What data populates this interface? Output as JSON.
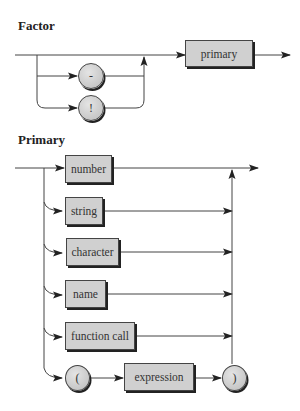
{
  "factor": {
    "title": "Factor",
    "optional_operators": [
      {
        "symbol": "-",
        "shape": "circle"
      },
      {
        "symbol": "!",
        "shape": "circle"
      }
    ],
    "element": {
      "label": "primary",
      "shape": "box"
    }
  },
  "primary": {
    "title": "Primary",
    "alternatives": [
      {
        "label": "number",
        "shape": "box"
      },
      {
        "label": "string",
        "shape": "box"
      },
      {
        "label": "character",
        "shape": "box"
      },
      {
        "label": "name",
        "shape": "box"
      },
      {
        "label": "function call",
        "shape": "box"
      }
    ],
    "paren_alternative": {
      "open": "(",
      "inner": "expression",
      "close": ")"
    }
  },
  "colors": {
    "box_fill": "#d0d0d0",
    "line": "#333333",
    "shadow": "#222222"
  }
}
